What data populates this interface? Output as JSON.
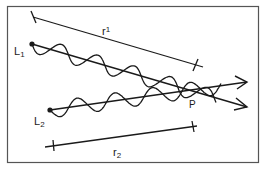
{
  "figure": {
    "labels": {
      "source_1": "L",
      "source_1_sub": "1",
      "source_2": "L",
      "source_2_sub": "2",
      "path_1": "r",
      "path_1_sub": "1",
      "path_2": "r",
      "path_2_sub": "2",
      "point": "P"
    },
    "colors": {
      "ink": "#1a1a1a",
      "frame": "#555555",
      "background": "#ffffff"
    }
  }
}
